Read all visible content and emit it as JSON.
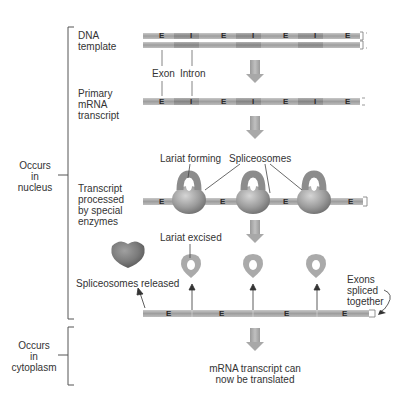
{
  "stages": {
    "dna_template": "DNA\ntemplate",
    "primary_transcript": "Primary\nmRNA\ntranscript",
    "processed": "Transcript\nprocessed\nby special\nenzymes"
  },
  "locations": {
    "nucleus": "Occurs\nin\nnucleus",
    "cytoplasm": "Occurs\nin\ncytoplasm"
  },
  "annotations": {
    "exon": "Exon",
    "intron": "Intron",
    "lariat_forming": "Lariat forming",
    "spliceosomes": "Spliceosomes",
    "lariat_excised": "Lariat excised",
    "spliceosomes_released": "Spliceosomes released",
    "exons_spliced": "Exons\nspliced\ntogether",
    "translated": "mRNA transcript can\nnow be translated"
  },
  "strand_labels": {
    "exon": "E",
    "intron": "I"
  },
  "segments": [
    "E",
    "I",
    "E",
    "I",
    "E",
    "I",
    "E"
  ],
  "colors": {
    "exon": "#a9a9a9",
    "intron": "#8f8f8f",
    "arrow": "#a8a8a8",
    "spliceosome": "#9a9a9a",
    "released_spliceosome": "#7a7a7a",
    "bracket": "#555555"
  }
}
